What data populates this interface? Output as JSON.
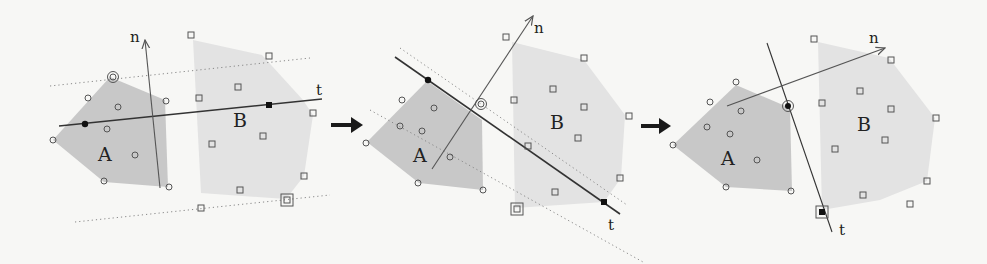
{
  "figure": {
    "panels": [
      {
        "id": "step-1",
        "set_a_label": "A",
        "set_b_label": "B",
        "axis_t_label": "t",
        "normal_n_label": "n"
      },
      {
        "id": "step-2",
        "set_a_label": "A",
        "set_b_label": "B",
        "axis_t_label": "t",
        "normal_n_label": "n"
      },
      {
        "id": "step-3",
        "set_a_label": "A",
        "set_b_label": "B",
        "axis_t_label": "t",
        "normal_n_label": "n"
      }
    ],
    "transitions": [
      "step-1-to-step-2",
      "step-2-to-step-3"
    ],
    "legend": {
      "circle_marker": "point of set A",
      "square_marker": "point of set B",
      "filled_marker": "support point on axis t",
      "double_marker": "extreme point defining dotted bound"
    }
  }
}
